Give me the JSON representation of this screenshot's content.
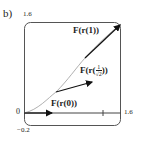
{
  "figure": {
    "part_label": "b)",
    "y_max_label": "1.6",
    "x_max_label": "1.6",
    "origin_label": "0",
    "y_min_label": "−0.2",
    "x_tick_label": "1"
  },
  "vectors": [
    {
      "label": "F(r(0))"
    },
    {
      "label_prefix": "F(r(",
      "label_num": "1",
      "label_den": "√2",
      "label_suffix": "))"
    },
    {
      "label": "F(r(1))"
    }
  ],
  "colors": {
    "frame": "#555555",
    "curve": "#b0b0b0",
    "arrow": "#111111",
    "axis": "#444444"
  }
}
